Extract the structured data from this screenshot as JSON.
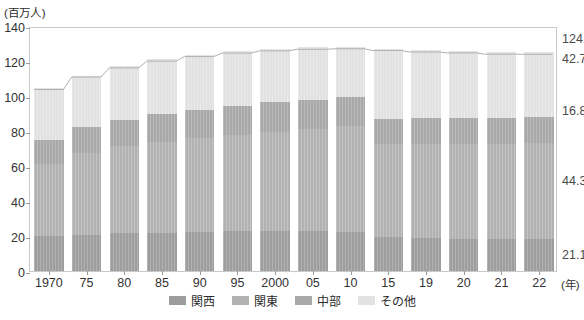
{
  "chart_data": {
    "type": "bar",
    "title": "",
    "subtitle": "",
    "unit_caption": "(百万人)",
    "xlabel": "(年)",
    "ylabel": "",
    "ylim": [
      0,
      140
    ],
    "yticks": [
      0,
      20,
      40,
      60,
      80,
      100,
      120,
      140
    ],
    "grid": false,
    "stacked": true,
    "legend_position": "bottom",
    "categories": [
      "1970",
      "75",
      "80",
      "85",
      "90",
      "95",
      "2000",
      "05",
      "10",
      "15",
      "19",
      "20",
      "21",
      "22"
    ],
    "series": [
      {
        "name": "関西",
        "color": "#9d9d9d",
        "values": [
          19.8,
          20.8,
          21.5,
          21.9,
          22.3,
          22.6,
          22.7,
          22.6,
          22.5,
          22.2,
          21.6,
          21.5,
          21.3,
          21.1
        ]
      },
      {
        "name": "関東",
        "color": "#b2b2b2",
        "values": [
          41.5,
          46.8,
          49.8,
          52.1,
          53.8,
          55.3,
          57.0,
          58.4,
          60.1,
          61.5,
          62.6,
          62.8,
          62.9,
          63.1
        ]
      },
      {
        "name": "中部",
        "color": "#a8a8a8",
        "values": [
          13.5,
          14.5,
          15.1,
          15.6,
          16.0,
          16.4,
          16.7,
          16.9,
          17.0,
          17.0,
          16.9,
          16.9,
          16.8,
          16.8
        ]
      },
      {
        "name": "その他",
        "color": "#e2e2e2",
        "values": [
          29.6,
          29.3,
          30.5,
          31.6,
          31.5,
          31.3,
          30.5,
          29.9,
          28.4,
          46.3,
          45.1,
          44.4,
          43.5,
          42.7
        ]
      }
    ],
    "totals": [
      104.7,
      111.9,
      117.1,
      121.0,
      123.6,
      125.6,
      126.9,
      127.8,
      128.1,
      127.1,
      126.2,
      125.7,
      125.0,
      124.9
    ],
    "value_labels": {
      "total": "124.9",
      "other": "42.7",
      "chubu": "16.8",
      "kanto": "44.3",
      "kansai": "21.1"
    }
  },
  "axis": {
    "unit_caption": "(百万人)",
    "x_unit": "(年)",
    "y_tick_labels": [
      "0",
      "20",
      "40",
      "60",
      "80",
      "100",
      "120",
      "140"
    ],
    "x_tick_labels": [
      "1970",
      "75",
      "80",
      "85",
      "90",
      "95",
      "2000",
      "05",
      "10",
      "15",
      "19",
      "20",
      "21",
      "22"
    ]
  },
  "legend": {
    "items": [
      {
        "label": "関西",
        "color": "#9d9d9d"
      },
      {
        "label": "関東",
        "color": "#b2b2b2"
      },
      {
        "label": "中部",
        "color": "#a8a8a8"
      },
      {
        "label": "その他",
        "color": "#e2e2e2"
      }
    ]
  }
}
